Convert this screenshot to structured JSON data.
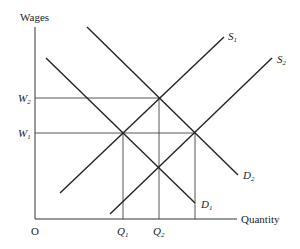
{
  "diagram": {
    "type": "supply-demand",
    "y_axis_label": "Wages",
    "x_axis_label": "Quantity",
    "origin_label": "O",
    "wage_levels": [
      {
        "label": "W",
        "sub": "2"
      },
      {
        "label": "W",
        "sub": "1"
      }
    ],
    "quantity_levels": [
      {
        "label": "Q",
        "sub": "1"
      },
      {
        "label": "Q",
        "sub": "2"
      }
    ],
    "curves": [
      {
        "name": "S",
        "sub": "1"
      },
      {
        "name": "S",
        "sub": "2"
      },
      {
        "name": "D",
        "sub": "1"
      },
      {
        "name": "D",
        "sub": "2"
      }
    ],
    "colors": {
      "line": "#222222",
      "guide": "#444444"
    }
  }
}
